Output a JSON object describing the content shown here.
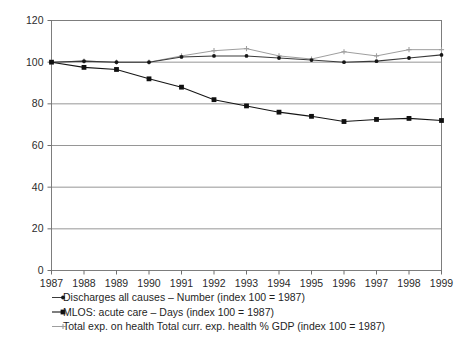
{
  "chart_data": {
    "type": "line",
    "title": "",
    "xlabel": "",
    "ylabel": "",
    "grid": true,
    "legend_position": "below-axis",
    "x": [
      1987,
      1988,
      1989,
      1990,
      1991,
      1992,
      1993,
      1994,
      1995,
      1996,
      1997,
      1998,
      1999
    ],
    "categories": [
      "1987",
      "1988",
      "1989",
      "1990",
      "1991",
      "1992",
      "1993",
      "1994",
      "1995",
      "1996",
      "1997",
      "1998",
      "1999"
    ],
    "xlim": [
      1987,
      1999
    ],
    "ylim": [
      0,
      120
    ],
    "yticks": [
      0,
      20,
      40,
      60,
      80,
      100,
      120
    ],
    "ytick_labels": [
      "0",
      "20",
      "40",
      "60",
      "80",
      "100",
      "120"
    ],
    "series": [
      {
        "name": "Discharges all causes – Number (index 100 = 1987)",
        "marker": "dot",
        "color": "#151515",
        "values": [
          100,
          100.5,
          100,
          100,
          102.5,
          103,
          103,
          102,
          101,
          100,
          100.5,
          102,
          103.5
        ]
      },
      {
        "name": "MLOS: acute care – Days (index 100 = 1987)",
        "marker": "square",
        "color": "#101010",
        "values": [
          100,
          97.5,
          96.5,
          92,
          88,
          82,
          79,
          76,
          74,
          71.5,
          72.5,
          73,
          72
        ]
      },
      {
        "name": "Total exp. on health Total curr. exp. health % GDP (index 100 = 1987)",
        "marker": "cross",
        "color": "#9e9e9e",
        "values": [
          100,
          100.5,
          100,
          100,
          103,
          105.5,
          106.5,
          103,
          101.5,
          105,
          103,
          106,
          106
        ]
      }
    ]
  },
  "legend": {
    "entries": [
      {
        "label": "Discharges all causes – Number (index 100 = 1987)",
        "marker": "dot"
      },
      {
        "label": "MLOS: acute care – Days (index 100 = 1987)",
        "marker": "square"
      },
      {
        "label": "Total exp. on health Total curr. exp. health % GDP (index 100 = 1987)",
        "marker": "cross"
      }
    ]
  }
}
